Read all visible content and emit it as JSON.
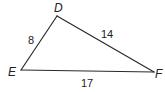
{
  "figure": {
    "type": "triangle",
    "stroke_color": "#2a2a2a",
    "text_color": "#222222",
    "background": "#ffffff",
    "vertices": [
      {
        "name": "D",
        "label": "D"
      },
      {
        "name": "E",
        "label": "E"
      },
      {
        "name": "F",
        "label": "F"
      }
    ],
    "sides": [
      {
        "between": "DE",
        "length_label": "8"
      },
      {
        "between": "DF",
        "length_label": "14"
      },
      {
        "between": "EF",
        "length_label": "17"
      }
    ]
  }
}
